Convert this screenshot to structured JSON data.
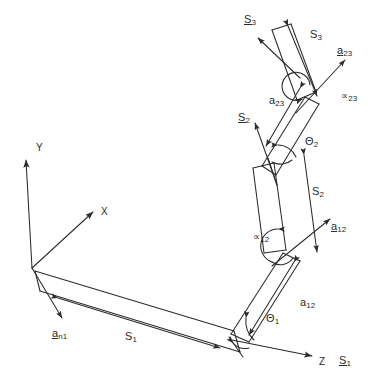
{
  "figure": {
    "type": "line-drawing",
    "background_color": "#ffffff",
    "ink_color": "#2b2b2b",
    "width": 377,
    "height": 388
  },
  "axes": {
    "origin_label": "",
    "items": [
      {
        "id": "y",
        "label": "Y",
        "x": 36,
        "y": 143
      },
      {
        "id": "x",
        "label": "X",
        "x": 101,
        "y": 207
      },
      {
        "id": "z",
        "label": "Z",
        "x": 319,
        "y": 357
      }
    ]
  },
  "labels": [
    {
      "id": "S3-vector",
      "base": "S",
      "sub": "3",
      "underline": true,
      "x": 244,
      "y": 14,
      "kind": "vector"
    },
    {
      "id": "S3-scalar",
      "base": "S",
      "sub": "3",
      "underline": false,
      "x": 310,
      "y": 29,
      "kind": "scalar"
    },
    {
      "id": "a23-vector",
      "base": "a",
      "sub": "23",
      "underline": true,
      "x": 337,
      "y": 45,
      "kind": "vector"
    },
    {
      "id": "a23-scalar",
      "base": "a",
      "sub": "23",
      "underline": false,
      "x": 269,
      "y": 95,
      "kind": "scalar"
    },
    {
      "id": "alpha23",
      "base": "∝",
      "sub": "23",
      "underline": false,
      "x": 341,
      "y": 90,
      "kind": "angle"
    },
    {
      "id": "S2-vector",
      "base": "S",
      "sub": "2",
      "underline": true,
      "x": 238,
      "y": 112,
      "kind": "vector"
    },
    {
      "id": "theta2",
      "base": "Θ",
      "sub": "2",
      "underline": false,
      "x": 305,
      "y": 136,
      "kind": "angle"
    },
    {
      "id": "S2-scalar",
      "base": "S",
      "sub": "2",
      "underline": false,
      "x": 312,
      "y": 186,
      "kind": "scalar"
    },
    {
      "id": "a12-vector",
      "base": "a",
      "sub": "12",
      "underline": true,
      "x": 331,
      "y": 221,
      "kind": "vector"
    },
    {
      "id": "alpha12",
      "base": "∝",
      "sub": "12",
      "underline": false,
      "x": 253,
      "y": 231,
      "kind": "angle"
    },
    {
      "id": "a12-scalar",
      "base": "a",
      "sub": "12",
      "underline": false,
      "x": 300,
      "y": 297,
      "kind": "scalar"
    },
    {
      "id": "theta1",
      "base": "Θ",
      "sub": "1",
      "underline": false,
      "x": 266,
      "y": 313,
      "kind": "angle"
    },
    {
      "id": "S1-vector",
      "base": "S",
      "sub": "1",
      "underline": true,
      "x": 339,
      "y": 355,
      "kind": "vector"
    },
    {
      "id": "an1-vector",
      "base": "a",
      "sub": "n1",
      "underline": true,
      "x": 52,
      "y": 328,
      "kind": "vector"
    },
    {
      "id": "S1-scalar",
      "base": "S",
      "sub": "1",
      "underline": false,
      "x": 125,
      "y": 331,
      "kind": "scalar"
    }
  ],
  "geometry": {
    "origin": {
      "x": 32,
      "y": 268
    },
    "joint1": {
      "x": 229,
      "y": 334
    },
    "joint2": {
      "x": 281,
      "y": 255
    },
    "joint3": {
      "x": 268,
      "y": 164
    },
    "joint4": {
      "x": 312,
      "y": 95
    }
  }
}
